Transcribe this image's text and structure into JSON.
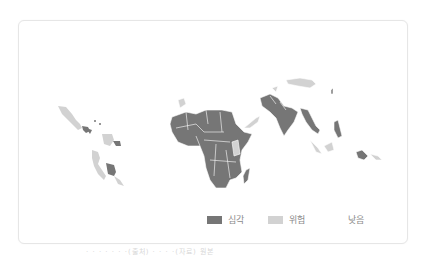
{
  "map": {
    "title": "",
    "colors": {
      "severe": "#767676",
      "warning": "#cfcfcf",
      "low": "#ffffff",
      "border": "#ffffff"
    }
  },
  "legend": {
    "items": [
      {
        "label": "심각",
        "color": "#767676"
      },
      {
        "label": "위험",
        "color": "#d2d2d2"
      },
      {
        "label": "낮음",
        "color": "#ffffff"
      }
    ]
  },
  "caption": "· · · · · · ·(출처) · · · ·(자료) 원본"
}
